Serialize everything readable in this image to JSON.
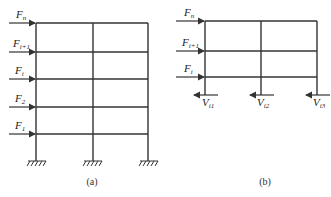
{
  "figure_a": {
    "caption": "(a)",
    "forces": [
      {
        "base": "F",
        "sub": "n",
        "y": 23
      },
      {
        "base": "F",
        "sub": "i+1",
        "y": 52
      },
      {
        "base": "F",
        "sub": "i",
        "y": 79
      },
      {
        "base": "F",
        "sub": "2",
        "y": 107
      },
      {
        "base": "F",
        "sub": "1",
        "y": 134
      }
    ]
  },
  "figure_b": {
    "caption": "(b)",
    "forces": [
      {
        "base": "F",
        "sub": "n",
        "y": 21
      },
      {
        "base": "F",
        "sub": "i+1",
        "y": 51
      },
      {
        "base": "F",
        "sub": "i",
        "y": 77
      }
    ],
    "shears": [
      {
        "base": "V",
        "sub": "i1"
      },
      {
        "base": "V",
        "sub": "i2"
      },
      {
        "base": "V",
        "sub": "i3"
      }
    ]
  },
  "colors": {
    "line": "#333333"
  }
}
